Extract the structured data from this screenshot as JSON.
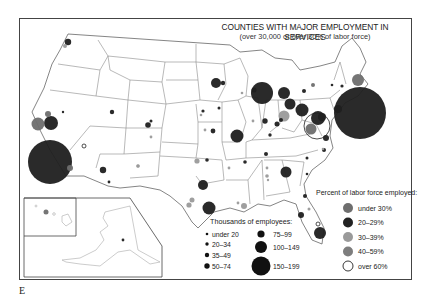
{
  "map": {
    "title": "COUNTIES WITH MAJOR EMPLOYMENT IN SERVICES",
    "subtitle": "(over 30,000 or over 30% of labor force)",
    "figure_label": "E"
  },
  "legend_size": {
    "title": "Thousands of employees:",
    "items": [
      {
        "label": "under 20",
        "r": 1.3
      },
      {
        "label": "20–34",
        "r": 1.7
      },
      {
        "label": "35–49",
        "r": 2.2
      },
      {
        "label": "50–74",
        "r": 2.7
      },
      {
        "label": "75–99",
        "r": 3.6
      },
      {
        "label": "100–149",
        "r": 6
      },
      {
        "label": "150–199",
        "r": 9.5
      }
    ]
  },
  "legend_percent": {
    "title": "Percent of labor force employed:",
    "items": [
      {
        "label": "under 30%",
        "color": "#6e6e6e"
      },
      {
        "label": "20–29%",
        "color": "#222222"
      },
      {
        "label": "30–39%",
        "color": "#9a9a9a"
      },
      {
        "label": "40–59%",
        "color": "#7d7d7d"
      },
      {
        "label": "over 60%",
        "color": "#ffffff"
      }
    ]
  },
  "colors": {
    "dark": "#1f1f1f",
    "mid": "#6e6e6e",
    "light": "#9a9a9a",
    "outline": "#333333",
    "state_lines": "#8a8a8a"
  },
  "points": [
    {
      "name": "seattle",
      "x": 68,
      "y": 42,
      "r": 3.2,
      "c": "dark"
    },
    {
      "name": "tacoma",
      "x": 65,
      "y": 46,
      "r": 2,
      "c": "light"
    },
    {
      "name": "sf",
      "x": 38,
      "y": 124,
      "r": 6.5,
      "c": "mid"
    },
    {
      "name": "oakland",
      "x": 51,
      "y": 123,
      "r": 7,
      "c": "dark"
    },
    {
      "name": "sacramento",
      "x": 48,
      "y": 114,
      "r": 3,
      "c": "mid"
    },
    {
      "name": "reno",
      "x": 63,
      "y": 112,
      "r": 1.2,
      "c": "dark"
    },
    {
      "name": "la",
      "x": 50,
      "y": 162,
      "r": 22,
      "c": "dark"
    },
    {
      "name": "san-diego",
      "x": 70,
      "y": 168,
      "r": 3,
      "c": "mid"
    },
    {
      "name": "las-vegas",
      "x": 84,
      "y": 146,
      "r": 2,
      "c": "white"
    },
    {
      "name": "salt-lake",
      "x": 112,
      "y": 112,
      "r": 2.2,
      "c": "dark"
    },
    {
      "name": "phoenix",
      "x": 103,
      "y": 170,
      "r": 3.2,
      "c": "dark"
    },
    {
      "name": "tucson",
      "x": 109,
      "y": 182,
      "r": 1.4,
      "c": "dark"
    },
    {
      "name": "albuquerque",
      "x": 138,
      "y": 166,
      "r": 1.8,
      "c": "light"
    },
    {
      "name": "denver",
      "x": 148,
      "y": 125,
      "r": 2.8,
      "c": "dark"
    },
    {
      "name": "boulder",
      "x": 151,
      "y": 121,
      "r": 1.5,
      "c": "dark"
    },
    {
      "name": "colorado-springs",
      "x": 151,
      "y": 137,
      "r": 1.4,
      "c": "light"
    },
    {
      "name": "el-paso",
      "x": 138,
      "y": 166,
      "r": 1.5,
      "c": "light"
    },
    {
      "name": "omaha",
      "x": 203,
      "y": 111,
      "r": 1.6,
      "c": "dark"
    },
    {
      "name": "lincoln",
      "x": 201,
      "y": 115,
      "r": 1.3,
      "c": "light"
    },
    {
      "name": "minneapolis",
      "x": 216,
      "y": 83,
      "r": 5,
      "c": "dark"
    },
    {
      "name": "st-paul",
      "x": 223,
      "y": 83,
      "r": 2.2,
      "c": "dark"
    },
    {
      "name": "des-moines",
      "x": 219,
      "y": 108,
      "r": 1.5,
      "c": "dark"
    },
    {
      "name": "kansas-city",
      "x": 213,
      "y": 131,
      "r": 2.4,
      "c": "dark"
    },
    {
      "name": "wichita",
      "x": 205,
      "y": 130,
      "r": 1.4,
      "c": "light"
    },
    {
      "name": "tulsa",
      "x": 207,
      "y": 160,
      "r": 1.8,
      "c": "dark"
    },
    {
      "name": "oklahoma-city",
      "x": 197,
      "y": 161,
      "r": 2.6,
      "c": "light"
    },
    {
      "name": "dallas",
      "x": 203,
      "y": 185,
      "r": 5,
      "c": "dark"
    },
    {
      "name": "austin",
      "x": 192,
      "y": 200,
      "r": 2.5,
      "c": "light"
    },
    {
      "name": "san-antonio",
      "x": 189,
      "y": 205,
      "r": 2.6,
      "c": "light"
    },
    {
      "name": "houston",
      "x": 209,
      "y": 208,
      "r": 6.5,
      "c": "dark"
    },
    {
      "name": "chicago",
      "x": 262,
      "y": 93,
      "r": 11,
      "c": "dark"
    },
    {
      "name": "milwaukee",
      "x": 254,
      "y": 90,
      "r": 2.5,
      "c": "dark"
    },
    {
      "name": "madison",
      "x": 242,
      "y": 93,
      "r": 1.3,
      "c": "light"
    },
    {
      "name": "st-louis",
      "x": 237,
      "y": 136,
      "r": 6.5,
      "c": "dark"
    },
    {
      "name": "springfield-il",
      "x": 253,
      "y": 121,
      "r": 1.4,
      "c": "light"
    },
    {
      "name": "indianapolis",
      "x": 265,
      "y": 121,
      "r": 2.7,
      "c": "dark"
    },
    {
      "name": "detroit",
      "x": 284,
      "y": 93,
      "r": 6,
      "c": "dark"
    },
    {
      "name": "toledo",
      "x": 290,
      "y": 104,
      "r": 5.5,
      "c": "dark"
    },
    {
      "name": "columbus",
      "x": 284,
      "y": 116,
      "r": 5.5,
      "c": "light"
    },
    {
      "name": "cincinnati",
      "x": 277,
      "y": 124,
      "r": 2.5,
      "c": "dark"
    },
    {
      "name": "dayton",
      "x": 281,
      "y": 120,
      "r": 2,
      "c": "dark"
    },
    {
      "name": "louisville",
      "x": 270,
      "y": 135,
      "r": 1.7,
      "c": "dark"
    },
    {
      "name": "cleveland",
      "x": 302,
      "y": 110,
      "r": 6.5,
      "c": "dark"
    },
    {
      "name": "pittsburgh",
      "x": 322,
      "y": 117,
      "r": 4,
      "c": "dark"
    },
    {
      "name": "buffalo",
      "x": 304,
      "y": 91,
      "r": 2,
      "c": "dark"
    },
    {
      "name": "rochester",
      "x": 313,
      "y": 85,
      "r": 2,
      "c": "mid"
    },
    {
      "name": "albany",
      "x": 332,
      "y": 85,
      "r": 1.3,
      "c": "dark"
    },
    {
      "name": "boston",
      "x": 358,
      "y": 80,
      "r": 6,
      "c": "mid"
    },
    {
      "name": "new-york",
      "x": 360,
      "y": 113,
      "r": 26,
      "c": "dark"
    },
    {
      "name": "philadelphia",
      "x": 338,
      "y": 109,
      "r": 4,
      "c": "dark"
    },
    {
      "name": "hartford",
      "x": 342,
      "y": 86,
      "r": 1.6,
      "c": "dark"
    },
    {
      "name": "baltimore",
      "x": 318,
      "y": 118,
      "r": 7,
      "c": "dark"
    },
    {
      "name": "washington",
      "x": 317,
      "y": 126,
      "r": 13,
      "c": "white"
    },
    {
      "name": "arlington",
      "x": 311,
      "y": 129,
      "r": 5.5,
      "c": "mid"
    },
    {
      "name": "richmond",
      "x": 326,
      "y": 138,
      "r": 3,
      "c": "dark"
    },
    {
      "name": "norfolk",
      "x": 323,
      "y": 149,
      "r": 1.3,
      "c": "light"
    },
    {
      "name": "raleigh",
      "x": 324,
      "y": 150,
      "r": 2,
      "c": "dark"
    },
    {
      "name": "charlotte",
      "x": 307,
      "y": 158,
      "r": 1.5,
      "c": "dark"
    },
    {
      "name": "nashville",
      "x": 266,
      "y": 154,
      "r": 2,
      "c": "dark"
    },
    {
      "name": "memphis",
      "x": 245,
      "y": 162,
      "r": 1.8,
      "c": "dark"
    },
    {
      "name": "little-rock",
      "x": 229,
      "y": 168,
      "r": 1.4,
      "c": "light"
    },
    {
      "name": "birmingham",
      "x": 267,
      "y": 168,
      "r": 1.4,
      "c": "light"
    },
    {
      "name": "huntsville",
      "x": 267,
      "y": 176,
      "r": 1.8,
      "c": "light"
    },
    {
      "name": "montgomery",
      "x": 268,
      "y": 180,
      "r": 1.2,
      "c": "light"
    },
    {
      "name": "atlanta",
      "x": 286,
      "y": 172,
      "r": 5.5,
      "c": "dark"
    },
    {
      "name": "atlanta-2",
      "x": 307,
      "y": 174,
      "r": 1.3,
      "c": "dark"
    },
    {
      "name": "new-orleans",
      "x": 244,
      "y": 206,
      "r": 3,
      "c": "light"
    },
    {
      "name": "baton-rouge",
      "x": 238,
      "y": 203,
      "r": 1.4,
      "c": "light"
    },
    {
      "name": "jacksonville",
      "x": 305,
      "y": 196,
      "r": 2,
      "c": "dark"
    },
    {
      "name": "tampa",
      "x": 301,
      "y": 215,
      "r": 3,
      "c": "dark"
    },
    {
      "name": "orlando",
      "x": 309,
      "y": 209,
      "r": 1.5,
      "c": "light"
    },
    {
      "name": "miami",
      "x": 320,
      "y": 233,
      "r": 6,
      "c": "dark"
    },
    {
      "name": "fort-lauderdale",
      "x": 318,
      "y": 224,
      "r": 2,
      "c": "white"
    },
    {
      "name": "honolulu",
      "x": 46,
      "y": 212,
      "r": 2.5,
      "c": "mid"
    },
    {
      "name": "anchorage",
      "x": 123,
      "y": 240,
      "r": 1.4,
      "c": "dark"
    }
  ]
}
